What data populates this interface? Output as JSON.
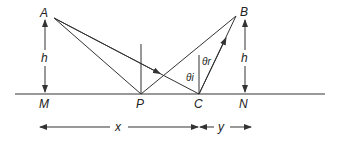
{
  "diagram": {
    "points": {
      "A": "A",
      "B": "B",
      "M": "M",
      "P": "P",
      "C": "C",
      "N": "N"
    },
    "heights": {
      "left": "h",
      "right": "h"
    },
    "distances": {
      "x": "x",
      "y": "y"
    },
    "angles": {
      "incident": "θi",
      "reflected": "θr"
    },
    "stroke_color": "#333333"
  }
}
